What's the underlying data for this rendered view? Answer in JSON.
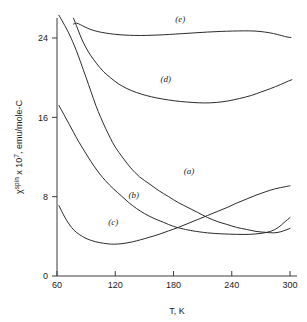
{
  "chart_data": {
    "type": "line",
    "title": "",
    "xlabel": "T, K",
    "ylabel": "χspin x 107, emu/mole-C",
    "ylabel_parts": {
      "chi": "χ",
      "chi_sup": "spin",
      "mid": " x 10",
      "exp": "7",
      "tail": ", emu/mole-C"
    },
    "xlim": [
      60,
      300
    ],
    "ylim": [
      0,
      26.5
    ],
    "xticks": [
      60,
      120,
      180,
      240,
      300
    ],
    "yticks": [
      0,
      8,
      16,
      24
    ],
    "xtick_labels": [
      "60",
      "120",
      "180",
      "240",
      "300"
    ],
    "ytick_labels": [
      "0",
      "8",
      "16",
      "24"
    ],
    "grid": false,
    "legend": "inline-curve-labels",
    "series": [
      {
        "name": "(a)",
        "label": "(a)",
        "label_x": 196,
        "label_y": 10.3,
        "points": [
          [
            62,
            26.3
          ],
          [
            66,
            25.6
          ],
          [
            70,
            24.9
          ],
          [
            74,
            24.1
          ],
          [
            78,
            23.2
          ],
          [
            82,
            22.2
          ],
          [
            86,
            21.1
          ],
          [
            90,
            20.0
          ],
          [
            95,
            18.6
          ],
          [
            100,
            17.2
          ],
          [
            105,
            16.0
          ],
          [
            110,
            14.9
          ],
          [
            115,
            13.9
          ],
          [
            120,
            13.0
          ],
          [
            128,
            11.9
          ],
          [
            136,
            10.9
          ],
          [
            145,
            10.0
          ],
          [
            155,
            9.3
          ],
          [
            165,
            8.6
          ],
          [
            175,
            8.0
          ],
          [
            185,
            7.4
          ],
          [
            195,
            6.9
          ],
          [
            205,
            6.4
          ],
          [
            215,
            5.9
          ],
          [
            225,
            5.5
          ],
          [
            235,
            5.2
          ],
          [
            245,
            4.9
          ],
          [
            255,
            4.7
          ],
          [
            265,
            4.5
          ],
          [
            275,
            4.4
          ],
          [
            283,
            4.35
          ],
          [
            290,
            4.45
          ],
          [
            296,
            4.65
          ],
          [
            300,
            4.8
          ]
        ]
      },
      {
        "name": "(b)",
        "label": "(b)",
        "label_x": 139,
        "label_y": 7.9,
        "points": [
          [
            62,
            17.2
          ],
          [
            67,
            16.3
          ],
          [
            72,
            15.4
          ],
          [
            77,
            14.5
          ],
          [
            82,
            13.6
          ],
          [
            87,
            12.8
          ],
          [
            92,
            12.0
          ],
          [
            98,
            11.1
          ],
          [
            104,
            10.3
          ],
          [
            110,
            9.6
          ],
          [
            118,
            8.8
          ],
          [
            126,
            8.1
          ],
          [
            134,
            7.4
          ],
          [
            142,
            6.8
          ],
          [
            150,
            6.3
          ],
          [
            160,
            5.8
          ],
          [
            170,
            5.4
          ],
          [
            180,
            5.0
          ],
          [
            190,
            4.75
          ],
          [
            200,
            4.55
          ],
          [
            215,
            4.35
          ],
          [
            230,
            4.25
          ],
          [
            245,
            4.2
          ],
          [
            258,
            4.2
          ],
          [
            270,
            4.3
          ],
          [
            280,
            4.5
          ],
          [
            288,
            4.9
          ],
          [
            294,
            5.4
          ],
          [
            300,
            5.9
          ]
        ]
      },
      {
        "name": "(c)",
        "label": "(c)",
        "label_x": 118,
        "label_y": 5.1,
        "points": [
          [
            62,
            7.1
          ],
          [
            66,
            6.3
          ],
          [
            70,
            5.6
          ],
          [
            75,
            4.9
          ],
          [
            80,
            4.4
          ],
          [
            86,
            4.0
          ],
          [
            92,
            3.7
          ],
          [
            100,
            3.45
          ],
          [
            108,
            3.3
          ],
          [
            115,
            3.22
          ],
          [
            122,
            3.22
          ],
          [
            130,
            3.3
          ],
          [
            138,
            3.45
          ],
          [
            146,
            3.65
          ],
          [
            155,
            3.9
          ],
          [
            165,
            4.2
          ],
          [
            175,
            4.55
          ],
          [
            185,
            4.9
          ],
          [
            195,
            5.3
          ],
          [
            205,
            5.7
          ],
          [
            215,
            6.1
          ],
          [
            225,
            6.5
          ],
          [
            235,
            6.9
          ],
          [
            245,
            7.35
          ],
          [
            255,
            7.75
          ],
          [
            265,
            8.15
          ],
          [
            275,
            8.5
          ],
          [
            285,
            8.8
          ],
          [
            295,
            9.0
          ],
          [
            300,
            9.1
          ]
        ]
      },
      {
        "name": "(d)",
        "label": "(d)",
        "label_x": 172,
        "label_y": 19.6,
        "points": [
          [
            77,
            26.0
          ],
          [
            81,
            25.0
          ],
          [
            85,
            24.0
          ],
          [
            90,
            23.0
          ],
          [
            95,
            22.2
          ],
          [
            101,
            21.4
          ],
          [
            108,
            20.6
          ],
          [
            115,
            20.0
          ],
          [
            123,
            19.4
          ],
          [
            132,
            18.9
          ],
          [
            142,
            18.5
          ],
          [
            152,
            18.2
          ],
          [
            163,
            17.95
          ],
          [
            175,
            17.75
          ],
          [
            187,
            17.6
          ],
          [
            200,
            17.5
          ],
          [
            212,
            17.45
          ],
          [
            224,
            17.5
          ],
          [
            236,
            17.65
          ],
          [
            248,
            17.9
          ],
          [
            260,
            18.2
          ],
          [
            270,
            18.55
          ],
          [
            280,
            18.9
          ],
          [
            290,
            19.3
          ],
          [
            297,
            19.6
          ],
          [
            302,
            19.8
          ]
        ]
      },
      {
        "name": "(e)",
        "label": "(e)",
        "label_x": 187,
        "label_y": 25.6,
        "points": [
          [
            77,
            25.4
          ],
          [
            80,
            25.5
          ],
          [
            84,
            25.35
          ],
          [
            89,
            25.1
          ],
          [
            95,
            24.85
          ],
          [
            102,
            24.65
          ],
          [
            110,
            24.5
          ],
          [
            119,
            24.38
          ],
          [
            129,
            24.3
          ],
          [
            140,
            24.26
          ],
          [
            152,
            24.26
          ],
          [
            164,
            24.3
          ],
          [
            176,
            24.36
          ],
          [
            189,
            24.44
          ],
          [
            202,
            24.52
          ],
          [
            215,
            24.6
          ],
          [
            228,
            24.66
          ],
          [
            241,
            24.7
          ],
          [
            253,
            24.72
          ],
          [
            264,
            24.7
          ],
          [
            274,
            24.6
          ],
          [
            283,
            24.45
          ],
          [
            291,
            24.25
          ],
          [
            297,
            24.1
          ],
          [
            301,
            24.05
          ]
        ]
      }
    ]
  }
}
